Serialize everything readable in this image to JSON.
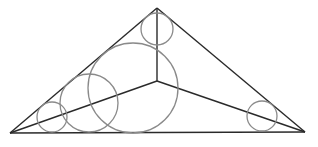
{
  "diagram": {
    "colors": {
      "edge": "#2a2a2a",
      "circle": "#8a8a8a",
      "background": "#ffffff"
    },
    "vertices": {
      "apex": [
        157,
        8
      ],
      "left": [
        10,
        133
      ],
      "right": [
        305,
        132
      ],
      "interior": [
        157,
        81
      ]
    },
    "circles": [
      {
        "name": "apex-circle",
        "cx": 157,
        "cy": 29,
        "r": 16
      },
      {
        "name": "large-circle",
        "cx": 133,
        "cy": 88,
        "r": 45
      },
      {
        "name": "medium-circle",
        "cx": 89,
        "cy": 103,
        "r": 29
      },
      {
        "name": "small-left-circle",
        "cx": 52,
        "cy": 117,
        "r": 15
      },
      {
        "name": "small-right-circle",
        "cx": 262,
        "cy": 116,
        "r": 15
      }
    ]
  }
}
